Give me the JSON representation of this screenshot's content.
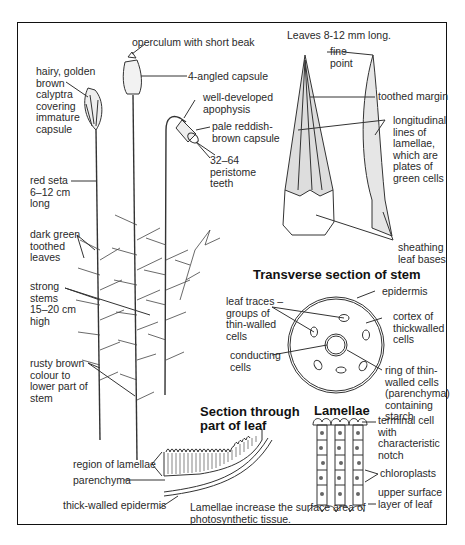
{
  "figure": {
    "plant": {
      "labels": {
        "calyptra": "hairy, golden\nbrown\ncalyptra\ncovering\nimmature\ncapsule",
        "operculum": "operculum with short beak",
        "four_angled": "4-angled capsule",
        "apophysis": "well-developed\napophysis",
        "pale_capsule": "pale reddish-\nbrown capsule",
        "peristome": "32–64\nperistome\nteeth",
        "seta": "red seta\n6–12 cm\nlong",
        "leaves": "dark green\ntoothed\nleaves",
        "stems": "strong\nstems\n15–20 cm\nhigh",
        "rusty": "rusty brown\ncolour to\nlower part of\nstem"
      }
    },
    "leaf": {
      "caption": "Leaves 8-12 mm long.",
      "labels": {
        "fine_point": "fine\npoint",
        "toothed_margin": "toothed margin",
        "longitudinal": "longitudinal\nlines of\nlamellae,\nwhich are\nplates of\ngreen cells",
        "sheathing": "sheathing\nleaf bases"
      }
    },
    "stem_section": {
      "title": "Transverse section of stem",
      "labels": {
        "epidermis": "epidermis",
        "leaf_traces": "leaf traces –\ngroups of\nthin-walled\ncells",
        "cortex": "cortex of\nthickwalled\ncells",
        "conducting": "conducting\ncells",
        "ring": "ring of thin-\nwalled cells\n(parenchyma)\ncontaining\nstarch"
      }
    },
    "leaf_section": {
      "title": "Section through\npart of leaf",
      "labels": {
        "region": "region of lamellae",
        "parenchyma": "parenchyma",
        "epidermis": "thick-walled epidermis"
      },
      "note": "Lamellae increase the surface area of\nphotosynthetic tissue."
    },
    "lamellae": {
      "title": "Lamellae",
      "labels": {
        "terminal": "terminal cell\nwith\ncharacteristic\nnotch",
        "chloroplasts": "chloroplasts",
        "upper_surface": "upper surface\nlayer of leaf"
      }
    },
    "colors": {
      "ink": "#222222",
      "frame": "#111111",
      "background": "#ffffff"
    }
  }
}
